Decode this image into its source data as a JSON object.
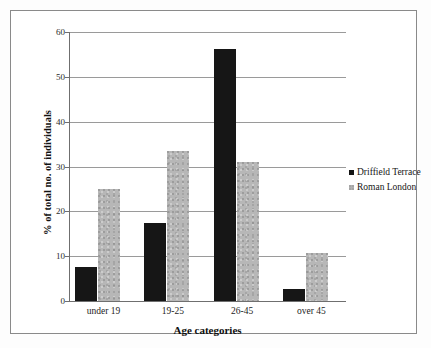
{
  "chart_data": {
    "type": "bar",
    "title": "",
    "xlabel": "Age categories",
    "ylabel": "% of total no. of individuals",
    "categories": [
      "under 19",
      "19-25",
      "26-45",
      "over 45"
    ],
    "series": [
      {
        "name": "Driffield Terrace",
        "color": "#161616",
        "values": [
          7.5,
          17.5,
          56.3,
          2.7
        ]
      },
      {
        "name": "Roman London",
        "color": "#b7b7b7",
        "values": [
          24.9,
          33.5,
          31.0,
          10.7
        ]
      }
    ],
    "ylim": [
      0,
      60
    ],
    "yticks": [
      0,
      10,
      20,
      30,
      40,
      50,
      60
    ],
    "ytick_labels": [
      "0",
      "10",
      "20",
      "30",
      "40",
      "50",
      "60"
    ],
    "grid": true,
    "legend_position": "right"
  },
  "legend": {
    "items": [
      {
        "label": "Driffield Terrace"
      },
      {
        "label": "Roman London"
      }
    ]
  },
  "axes": {
    "y_title": "% of total no. of individuals",
    "x_title": "Age categories"
  }
}
